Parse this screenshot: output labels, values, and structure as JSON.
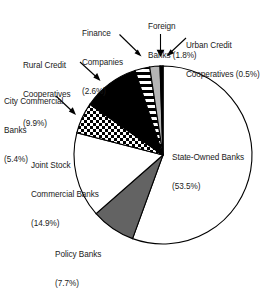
{
  "chart_data": {
    "type": "pie",
    "title": "",
    "subtitle": "",
    "xlabel": "",
    "ylabel": "",
    "legend_position": "callout-labels",
    "grid": false,
    "units": "percent",
    "start_angle_deg": 0,
    "direction": "clockwise",
    "categories": [
      "State-Owned Banks",
      "Policy Banks",
      "Joint Stock Commercial Banks",
      "City Commercial Banks",
      "Rural Credit Cooperatives",
      "Finance Companies",
      "Foreign Banks",
      "Urban Credit Cooperatives"
    ],
    "values": [
      53.5,
      7.7,
      14.9,
      5.4,
      9.9,
      2.6,
      1.8,
      0.5
    ],
    "slices": [
      {
        "label": "State-Owned Banks",
        "value": 53.5,
        "value_text": "(53.5%)",
        "fill": "white",
        "color": "#ffffff"
      },
      {
        "label": "Policy Banks",
        "value": 7.7,
        "value_text": "(7.7%)",
        "fill": "solid-gray",
        "color": "#636363"
      },
      {
        "label": "Joint Stock Commercial Banks",
        "value": 14.9,
        "value_text": "(14.9%)",
        "fill": "white",
        "color": "#ffffff"
      },
      {
        "label": "City Commercial Banks",
        "value": 5.4,
        "value_text": "(5.4%)",
        "fill": "checkerboard",
        "color": "#ffffff"
      },
      {
        "label": "Rural Credit Cooperatives",
        "value": 9.9,
        "value_text": "(9.9%)",
        "fill": "solid-black",
        "color": "#000000"
      },
      {
        "label": "Finance Companies",
        "value": 2.6,
        "value_text": "(2.6%)",
        "fill": "horizontal-stripes",
        "color": "#ffffff"
      },
      {
        "label": "Foreign Banks",
        "value": 1.8,
        "value_text": "(1.8%)",
        "fill": "light-gray",
        "color": "#b5b5b5"
      },
      {
        "label": "Urban Credit Cooperatives",
        "value": 0.5,
        "value_text": "(0.5%)",
        "fill": "solid-black",
        "color": "#000000"
      }
    ]
  },
  "labels": {
    "finance_companies": {
      "line1": "Finance",
      "line2": "Companies",
      "line3": "(2.6%)"
    },
    "foreign_banks": {
      "line1": "Foreign",
      "line2": "Banks (1.8%)"
    },
    "urban_credit": {
      "line1": "Urban Credit",
      "line2": "Cooperatives (0.5%)"
    },
    "rural_credit": {
      "line1": "Rural Credit",
      "line2": "Cooperatives",
      "line3": "(9.9%)"
    },
    "city_commercial": {
      "line1": "City Commercial",
      "line2": "Banks",
      "line3": "(5.4%)"
    },
    "joint_stock": {
      "line1": "Joint Stock",
      "line2": "Commercial Banks",
      "line3": "(14.9%)"
    },
    "policy_banks": {
      "line1": "Policy Banks",
      "line2": "(7.7%)"
    },
    "state_owned": {
      "line1": "State-Owned Banks",
      "line2": "(53.5%)"
    }
  }
}
